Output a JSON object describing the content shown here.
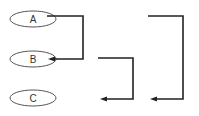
{
  "diagram": {
    "nodes": [
      {
        "id": "A",
        "label": "A",
        "cx": 33,
        "cy": 19,
        "rx": 23,
        "ry": 8
      },
      {
        "id": "B",
        "label": "B",
        "cx": 33,
        "cy": 59,
        "rx": 23,
        "ry": 8
      },
      {
        "id": "C",
        "label": "C",
        "cx": 33,
        "cy": 98,
        "rx": 23,
        "ry": 8
      }
    ],
    "connectors": [
      {
        "id": "a-to-b",
        "from": "A",
        "to": "B",
        "shape": "bracket-right-down-left"
      },
      {
        "id": "bracket-middle",
        "from": null,
        "to": null,
        "shape": "bracket-right-down-left"
      },
      {
        "id": "bracket-right",
        "from": null,
        "to": null,
        "shape": "bracket-right-down-left"
      }
    ],
    "colors": {
      "line": "#222222",
      "ellipse_stroke": "#555555",
      "text": "#333333",
      "background": "#ffffff"
    }
  }
}
